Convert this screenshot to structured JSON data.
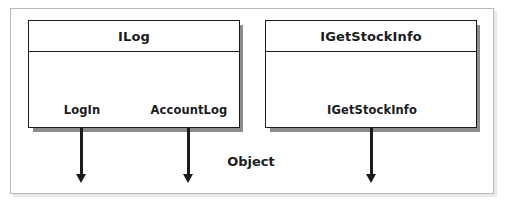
{
  "diagram": {
    "title": "Object",
    "object_label": "Object",
    "colors": {
      "stroke": "#1c1c1c",
      "frame": "#b9b9b9",
      "shadow": "#8c8c8c",
      "frame_shadow": "#e9e9e9",
      "background": "#ffffff"
    },
    "interfaces": [
      {
        "name": "ILog",
        "header_label": "ILog",
        "methods": [
          {
            "label": "LogIn"
          },
          {
            "label": "AccountLog"
          }
        ]
      },
      {
        "name": "IGetStockInfo",
        "header_label": "IGetStockInfo",
        "methods": [
          {
            "label": "IGetStockInfo"
          }
        ]
      }
    ],
    "connectors": [
      {
        "from": "LogIn",
        "direction": "down"
      },
      {
        "from": "AccountLog",
        "direction": "down"
      },
      {
        "from": "IGetStockInfo",
        "direction": "down"
      }
    ]
  }
}
